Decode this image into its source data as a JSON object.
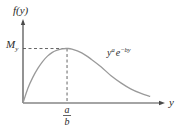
{
  "chart_data": {
    "type": "line",
    "title": "",
    "ylabel": "f(y)",
    "xlabel": "y",
    "function_label": {
      "base": "y",
      "exp1": "a",
      "mid": "e",
      "exp2": "−by"
    },
    "peak": {
      "x_label_num": "a",
      "x_label_den": "b",
      "y_label_main": "M",
      "y_label_sub": "y"
    },
    "series": [
      {
        "name": "y^a e^{-by}",
        "description": "Curve starting at origin, rising to a maximum M_y at y = a/b, then decaying toward zero",
        "x": [
          0,
          0.1,
          0.2,
          0.3,
          0.4,
          0.5,
          0.6,
          0.7,
          0.8,
          0.9,
          1.0,
          1.2,
          1.4,
          1.6,
          1.8,
          2.0,
          2.2,
          2.4,
          2.6
        ],
        "values": [
          0,
          0.27,
          0.47,
          0.63,
          0.76,
          0.86,
          0.93,
          0.97,
          0.995,
          1.0,
          0.99,
          0.92,
          0.8,
          0.66,
          0.5,
          0.37,
          0.26,
          0.18,
          0.12
        ]
      }
    ],
    "x_peak": 0.9,
    "y_peak": 1.0,
    "xlim": [
      0,
      2.8
    ],
    "ylim": [
      0,
      1.45
    ],
    "grid": false,
    "legend": "none"
  }
}
